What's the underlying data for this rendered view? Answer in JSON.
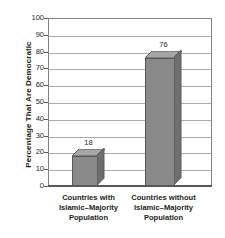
{
  "chart_data": {
    "type": "bar",
    "title": "",
    "subtitle": "",
    "xlabel": "",
    "ylabel": "Percentage That Are Democratic",
    "ylim": [
      0,
      100
    ],
    "ytick_step": 10,
    "ytick_labels": [
      "0",
      "10",
      "20",
      "30",
      "40",
      "50",
      "60",
      "70",
      "80",
      "90",
      "100"
    ],
    "grid": true,
    "legend": false,
    "legend_position": "none",
    "style": "3d-bars",
    "categories": [
      "Countries with Islamic–Majority Population",
      "Countries without Islamic–Majority Population"
    ],
    "category_lines": [
      [
        "Countries with",
        "Islamic–Majority",
        "Population"
      ],
      [
        "Countries without",
        "Islamic–Majority",
        "Population"
      ]
    ],
    "values": [
      18,
      76
    ],
    "value_labels": [
      "18",
      "76"
    ],
    "colors": {
      "bar_front": "#8a8a8a",
      "bar_top": "#a6a6a6",
      "bar_side": "#6e6e6e",
      "bar_outline": "#595959",
      "gridline": "#a7a9ac",
      "frame": "#808285",
      "axis": "#58595b",
      "text": "#231f20",
      "background": "#ffffff"
    }
  }
}
